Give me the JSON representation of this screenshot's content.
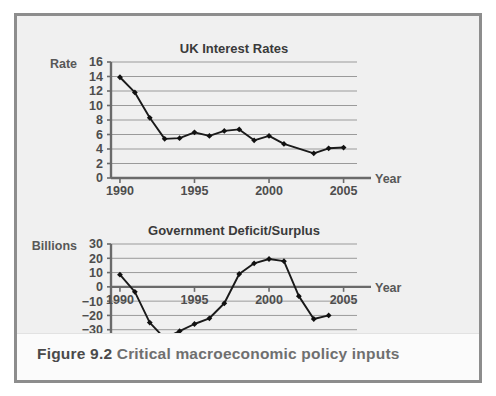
{
  "figure": {
    "number": "Figure 9.2",
    "caption": "Critical macroeconomic policy inputs"
  },
  "chart_data": [
    {
      "id": "uk-interest-rates",
      "type": "line",
      "title": "UK Interest Rates",
      "xlabel": "Year",
      "ylabel": "Rate",
      "xlim": [
        1989.4,
        2005.9
      ],
      "ylim": [
        0,
        16
      ],
      "grid": true,
      "legend": "none",
      "yticks": [
        0,
        2,
        4,
        6,
        8,
        10,
        12,
        14,
        16
      ],
      "ytick_labels": [
        "0",
        "2",
        "4",
        "6",
        "8",
        "10",
        "12",
        "14",
        "16"
      ],
      "xticks": [
        1990,
        1995,
        2000,
        2005
      ],
      "xtick_labels": [
        "1990",
        "1995",
        "2000",
        "2005"
      ],
      "x": [
        1990,
        1991,
        1992,
        1993,
        1994,
        1995,
        1996,
        1997,
        1998,
        1999,
        2000,
        2001,
        2003,
        2004,
        2005
      ],
      "values": [
        13.9,
        11.8,
        8.3,
        5.4,
        5.5,
        6.3,
        5.8,
        6.5,
        6.7,
        5.2,
        5.8,
        4.7,
        3.4,
        4.1,
        4.2
      ]
    },
    {
      "id": "government-deficit-surplus",
      "type": "line",
      "title": "Government Deficit/Surplus",
      "xlabel": "Year",
      "ylabel": "Billions",
      "xlim": [
        1989.4,
        2005.9
      ],
      "ylim": [
        -40,
        30
      ],
      "grid": true,
      "legend": "none",
      "yticks": [
        30,
        20,
        10,
        0,
        -10,
        -20,
        -30,
        -40
      ],
      "ytick_labels": [
        "30",
        "20",
        "10",
        "0",
        "−10",
        "−20",
        "−30",
        "−40"
      ],
      "xticks": [
        1990,
        1995,
        2000,
        2005
      ],
      "xtick_labels": [
        "1990",
        "1995",
        "2000",
        "2005"
      ],
      "x": [
        1990,
        1991,
        1992,
        1993,
        1994,
        1995,
        1996,
        1997,
        1998,
        1999,
        2000,
        2001,
        2002,
        2003,
        2004
      ],
      "values": [
        8.5,
        -3.5,
        -25,
        -36,
        -31,
        -26,
        -22,
        -11.5,
        9,
        16.5,
        19.5,
        18,
        -6.5,
        -22.5,
        -20
      ]
    }
  ]
}
